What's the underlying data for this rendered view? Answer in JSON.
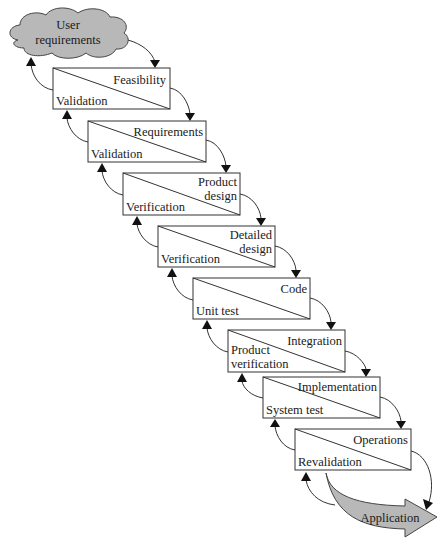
{
  "diagram": {
    "type": "waterfall-process",
    "colors": {
      "cloud_fill": "#b8b8b8",
      "application_arrow_fill": "#b8b8b8",
      "box_stroke": "#333333",
      "text": "#1a1a1a"
    },
    "start": {
      "label_line1": "User",
      "label_line2": "requirements"
    },
    "stages": [
      {
        "name": "Feasibility",
        "name_line2": "",
        "check": "Validation",
        "check_line2": ""
      },
      {
        "name": "Requirements",
        "name_line2": "",
        "check": "Validation",
        "check_line2": ""
      },
      {
        "name": "Product",
        "name_line2": "design",
        "check": "Verification",
        "check_line2": ""
      },
      {
        "name": "Detailed",
        "name_line2": "design",
        "check": "Verification",
        "check_line2": ""
      },
      {
        "name": "Code",
        "name_line2": "",
        "check": "Unit test",
        "check_line2": ""
      },
      {
        "name": "Integration",
        "name_line2": "",
        "check": "Product",
        "check_line2": "verification"
      },
      {
        "name": "Implementation",
        "name_line2": "",
        "check": "System test",
        "check_line2": ""
      },
      {
        "name": "Operations",
        "name_line2": "",
        "check": "Revalidation",
        "check_line2": ""
      }
    ],
    "end": {
      "label": "Application"
    }
  }
}
